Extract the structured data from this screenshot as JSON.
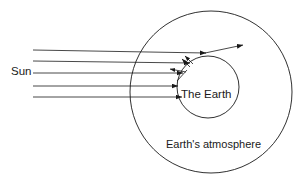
{
  "diagram": {
    "type": "physics-schematic",
    "canvas": {
      "width": 308,
      "height": 184,
      "background": "#ffffff"
    },
    "stroke_color": "#1a1a1a",
    "labels": {
      "sun": "Sun",
      "earth": "The Earth",
      "atmosphere": "Earth's atmosphere"
    },
    "shapes": {
      "atmosphere_circle": {
        "cx": 211,
        "cy": 92,
        "r": 81
      },
      "earth_circle": {
        "cx": 208,
        "cy": 87,
        "r": 31
      }
    },
    "incoming_rays": [
      {
        "name": "ray-1",
        "x1": 33,
        "y1": 50,
        "x2": 206,
        "y2": 53
      },
      {
        "name": "ray-2",
        "x1": 33,
        "y1": 61,
        "x2": 189,
        "y2": 62
      },
      {
        "name": "ray-3",
        "x1": 33,
        "y1": 73,
        "x2": 181,
        "y2": 73
      },
      {
        "name": "ray-4",
        "x1": 33,
        "y1": 86,
        "x2": 178,
        "y2": 86
      },
      {
        "name": "ray-5",
        "x1": 33,
        "y1": 97,
        "x2": 181,
        "y2": 97
      }
    ],
    "scattered_rays": [
      {
        "name": "scattered-ray-outgoing",
        "x1": 206,
        "y1": 53,
        "x2": 243,
        "y2": 45
      },
      {
        "name": "scattered-ray-up-left-a",
        "x1": 192,
        "y1": 63,
        "x2": 184,
        "y2": 56
      },
      {
        "name": "scattered-ray-up-left-b",
        "x1": 189,
        "y1": 66,
        "x2": 181,
        "y2": 59
      },
      {
        "name": "scattered-ray-left",
        "x1": 186,
        "y1": 73,
        "x2": 170,
        "y2": 69
      },
      {
        "name": "scattered-ray-down-left",
        "x1": 186,
        "y1": 70,
        "x2": 176,
        "y2": 80
      }
    ]
  }
}
